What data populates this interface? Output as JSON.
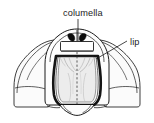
{
  "figure": {
    "kind": "line-drawing",
    "background_color": "#ffffff",
    "ink_color": "#1b1b1b",
    "fill_light": "#f3f3f3",
    "fill_mid": "#e4e4e4",
    "fill_dark": "#0d0d0d",
    "labels": [
      {
        "id": "columella",
        "text": "columella",
        "text_x": 63,
        "text_y": 16,
        "anchor": "start",
        "leader_from_x": 78,
        "leader_from_y": 19,
        "leader_to_x": 78,
        "leader_to_y": 41
      },
      {
        "id": "lip",
        "text": "lip",
        "text_x": 130,
        "text_y": 45,
        "anchor": "start",
        "leader_from_x": 127,
        "leader_from_y": 41,
        "leader_to_x": 96,
        "leader_to_y": 59
      }
    ],
    "parts": [
      {
        "id": "body-whorl-outline",
        "label": "body whorl outline"
      },
      {
        "id": "left-wing",
        "label": "left shell wing"
      },
      {
        "id": "right-wing",
        "label": "right shell wing"
      },
      {
        "id": "apertural-lip",
        "label": "apertural lip (thick dark rim)"
      },
      {
        "id": "aperture-interior",
        "label": "aperture interior"
      },
      {
        "id": "columella-marks",
        "label": "columella dark paired marks"
      },
      {
        "id": "parietal-shield",
        "label": "parietal callus band"
      },
      {
        "id": "axis-dashes",
        "label": "dashed central axis"
      },
      {
        "id": "siphonal-notch",
        "label": "siphonal notch at base"
      }
    ]
  }
}
